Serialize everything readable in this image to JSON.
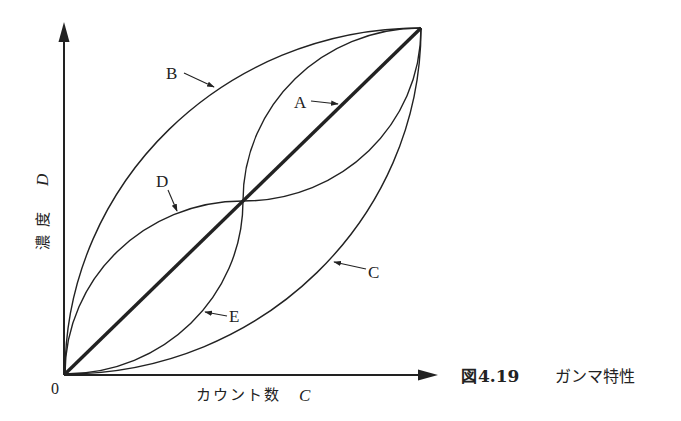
{
  "figure": {
    "caption_prefix": "図",
    "caption_number": "4.19",
    "caption_title": "ガンマ特性"
  },
  "axes": {
    "x_label_text": "カウント数",
    "x_label_var": "C",
    "y_label_text": "濃 度",
    "y_label_var": "D",
    "origin_label": "0"
  },
  "curves": [
    {
      "id": "A",
      "label": "A",
      "description": "linear (thick straight line)"
    },
    {
      "id": "B",
      "label": "B",
      "description": "concave, bows upward-left"
    },
    {
      "id": "C",
      "label": "C",
      "description": "convex, bows downward-right"
    },
    {
      "id": "D",
      "label": "D",
      "description": "S-shaped: rises fast, flattens at midpoint, rises steeply to end"
    },
    {
      "id": "E",
      "label": "E",
      "description": "inverse S-shaped: rises slowly, steep at midpoint, flattens to end"
    }
  ],
  "colors": {
    "ink": "#222222",
    "background": "#ffffff"
  }
}
